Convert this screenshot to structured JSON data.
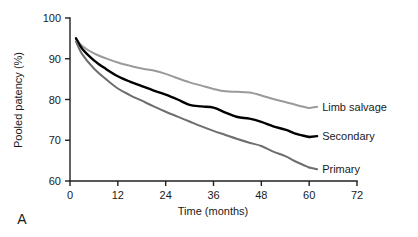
{
  "figure": {
    "panel_label": "A",
    "width": 418,
    "height": 237,
    "background": "#ffffff"
  },
  "chart_data": {
    "type": "line",
    "title": "",
    "subtitle": "",
    "xlabel": "Time (months)",
    "ylabel": "Pooled patency (%)",
    "xlim": [
      0,
      72
    ],
    "ylim": [
      60,
      100
    ],
    "xticks": [
      0,
      12,
      24,
      36,
      48,
      60,
      72
    ],
    "xtick_labels": [
      "0",
      "12",
      "24",
      "36",
      "48",
      "60",
      "72"
    ],
    "yticks": [
      60,
      70,
      80,
      90,
      100
    ],
    "ytick_labels": [
      "60",
      "70",
      "80",
      "90",
      "100"
    ],
    "grid": false,
    "legend_position": "right-inline-labels",
    "annotations": [
      "A"
    ],
    "series": [
      {
        "name": "Limb salvage",
        "color": "#9a9a9a",
        "stroke_width": 2.0,
        "label": "Limb salvage",
        "label_x": 62,
        "label_y": 78.2,
        "x": [
          1.5,
          3,
          6,
          9,
          12,
          15,
          18,
          21,
          24,
          27,
          30,
          33,
          36,
          39,
          42,
          45,
          48,
          51,
          54,
          57,
          60
        ],
        "y": [
          95.0,
          93.2,
          91.3,
          90.1,
          89.1,
          88.3,
          87.6,
          87.1,
          86.3,
          85.2,
          84.2,
          83.4,
          82.6,
          82.0,
          81.9,
          81.7,
          81.0,
          80.1,
          79.4,
          78.6,
          77.9
        ]
      },
      {
        "name": "Secondary",
        "color": "#000000",
        "stroke_width": 2.4,
        "label": "Secondary",
        "label_x": 62,
        "label_y": 71.0,
        "x": [
          1.5,
          3,
          6,
          9,
          12,
          15,
          18,
          21,
          24,
          27,
          30,
          33,
          36,
          39,
          42,
          45,
          48,
          51,
          54,
          57,
          60
        ],
        "y": [
          95.0,
          92.5,
          89.6,
          87.5,
          85.7,
          84.4,
          83.3,
          82.2,
          81.2,
          80.0,
          78.7,
          78.3,
          78.0,
          76.8,
          75.7,
          75.3,
          74.5,
          73.4,
          72.6,
          71.5,
          70.8
        ]
      },
      {
        "name": "Primary",
        "color": "#6e6e6e",
        "stroke_width": 2.0,
        "label": "Primary",
        "label_x": 62,
        "label_y": 62.9,
        "x": [
          1.5,
          3,
          6,
          9,
          12,
          15,
          18,
          21,
          24,
          27,
          30,
          33,
          36,
          39,
          42,
          45,
          48,
          51,
          54,
          57,
          60
        ],
        "y": [
          94.2,
          91.2,
          87.6,
          85.0,
          82.7,
          81.1,
          79.7,
          78.3,
          77.0,
          75.8,
          74.6,
          73.4,
          72.3,
          71.3,
          70.3,
          69.4,
          68.6,
          67.2,
          66.1,
          64.6,
          63.3
        ]
      }
    ]
  }
}
